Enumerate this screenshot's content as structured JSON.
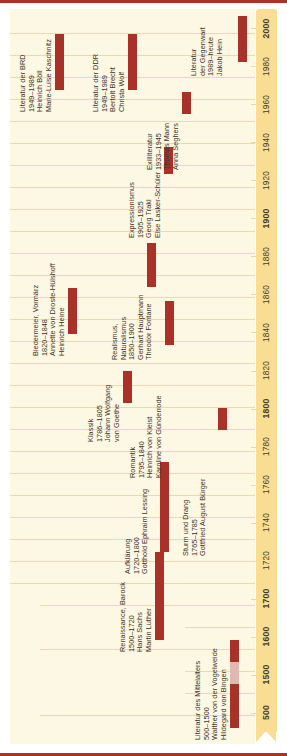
{
  "figure": {
    "colors": {
      "bar": "#a83228",
      "bar_faded": "#e2b9b0",
      "axis": "#f8dd92",
      "field": "#fdf8e3",
      "rule": "#b03026",
      "text": "#3b3127"
    }
  },
  "axis": {
    "orientation": "vertical",
    "ticks": [
      {
        "label": "500",
        "major": true
      },
      {
        "label": "1500",
        "major": true
      },
      {
        "label": "1600",
        "major": true
      },
      {
        "label": "1700",
        "major": true
      },
      {
        "label": "1720",
        "major": false
      },
      {
        "label": "1740",
        "major": false
      },
      {
        "label": "1760",
        "major": false
      },
      {
        "label": "1780",
        "major": false
      },
      {
        "label": "1800",
        "major": true
      },
      {
        "label": "1820",
        "major": false
      },
      {
        "label": "1840",
        "major": false
      },
      {
        "label": "1860",
        "major": false
      },
      {
        "label": "1880",
        "major": false
      },
      {
        "label": "1900",
        "major": true
      },
      {
        "label": "1920",
        "major": false
      },
      {
        "label": "1940",
        "major": false
      },
      {
        "label": "1960",
        "major": false
      },
      {
        "label": "1980",
        "major": false
      },
      {
        "label": "2000",
        "major": true
      }
    ]
  },
  "chart_data": {
    "type": "bar",
    "xlabel": "",
    "ylabel": "Jahr",
    "grid": true,
    "legend": "none",
    "categories": [
      "Literatur des Mittelalters",
      "Renaissance, Barock",
      "Aufklärung",
      "Sturm und Drang",
      "Klassik",
      "Romantik",
      "Biedermeier, Vormärz",
      "Realismus, Naturalismus",
      "Expressionismus",
      "Exilliteratur",
      "Literatur der DDR",
      "Literatur der BRD",
      "Literatur der Gegenwart"
    ],
    "spans": [
      {
        "name": "Literatur des Mittelalters",
        "start": 500,
        "end": 1500
      },
      {
        "name": "Renaissance, Barock",
        "start": 1500,
        "end": 1720
      },
      {
        "name": "Aufklärung",
        "start": 1720,
        "end": 1800
      },
      {
        "name": "Sturm und Drang",
        "start": 1765,
        "end": 1785
      },
      {
        "name": "Klassik",
        "start": 1786,
        "end": 1805
      },
      {
        "name": "Romantik",
        "start": 1795,
        "end": 1840
      },
      {
        "name": "Biedermeier, Vormärz",
        "start": 1820,
        "end": 1848
      },
      {
        "name": "Realismus, Naturalismus",
        "start": 1850,
        "end": 1900
      },
      {
        "name": "Expressionismus",
        "start": 1905,
        "end": 1925
      },
      {
        "name": "Exilliteratur",
        "start": 1933,
        "end": 1945
      },
      {
        "name": "Literatur der DDR",
        "start": 1949,
        "end": 1989
      },
      {
        "name": "Literatur der BRD",
        "start": 1949,
        "end": 1989
      },
      {
        "name": "Literatur der Gegenwart",
        "start": 1989,
        "end": 2024
      }
    ]
  },
  "eras": [
    {
      "id": "mittelalter",
      "name": "Literatur des Mittelalters",
      "years": "500–1500",
      "authors": [
        "Walther von der Vogelweide",
        "Hildegard von Bingen"
      ]
    },
    {
      "id": "renaissance-barock",
      "name": "Renaissance, Barock",
      "years": "1500–1720",
      "authors": [
        "Hans Sachs",
        "Martin Luther"
      ]
    },
    {
      "id": "aufklaerung",
      "name": "Aufklärung",
      "years": "1720–1800",
      "authors": [
        "Gotthold Ephraim Lessing"
      ]
    },
    {
      "id": "sturm-und-drang",
      "name": "Sturm und Drang",
      "years": "1765–1785",
      "authors": [
        "Gottfried August Bürger"
      ]
    },
    {
      "id": "klassik",
      "name": "Klassik",
      "years": "1786–1805",
      "authors": [
        "Johann Wolfgang",
        "von Goethe"
      ]
    },
    {
      "id": "romantik",
      "name": "Romantik",
      "years": "1795–1840",
      "authors": [
        "Heinrich von Kleist",
        "Karoline von Günderrode"
      ]
    },
    {
      "id": "biedermeier-vormaerz",
      "name": "Biedermeier, Vormärz",
      "years": "1820–1848",
      "authors": [
        "Annette von Droste-Hülshoff",
        "Heinrich Heine"
      ]
    },
    {
      "id": "realismus-naturalismus",
      "name": "Realismus,",
      "name2": "Naturalismus",
      "years": "1850–1900",
      "authors": [
        "Gerhart Hauptmann",
        "Theodor Fontane"
      ]
    },
    {
      "id": "expressionismus",
      "name": "Expressionismus",
      "years": "1905–1925",
      "authors": [
        "Georg Trakl",
        "Else Lasker-Schüler"
      ]
    },
    {
      "id": "exilliteratur",
      "name": "Exilliteratur",
      "years": "1933–1945",
      "authors": [
        "Thomas Mann",
        "Anna Seghers"
      ]
    },
    {
      "id": "ddr",
      "name": "Literatur der DDR",
      "years": "1949–1989",
      "authors": [
        "Bertolt Brecht",
        "Christa Wolf"
      ]
    },
    {
      "id": "brd",
      "name": "Literatur der BRD",
      "years": "1949–1989",
      "authors": [
        "Heinrich Böll",
        "Marie-Luise Kaschnitz"
      ]
    },
    {
      "id": "gegenwart",
      "name": "Literatur",
      "name2": "der Gegenwart",
      "years": "1989–heute",
      "authors": [
        "Jakob Hein"
      ]
    }
  ]
}
